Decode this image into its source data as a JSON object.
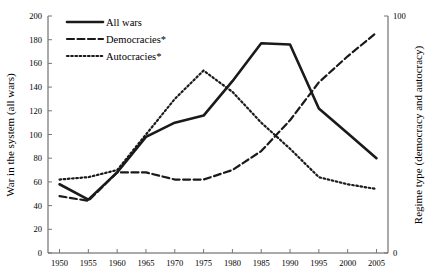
{
  "chart_data": {
    "type": "line",
    "title": "",
    "xlabel": "",
    "ylabel": "War in the system (all wars)",
    "y2label": "Regime type (democracy and autocracy)",
    "x": [
      1950,
      1955,
      1960,
      1965,
      1970,
      1975,
      1980,
      1985,
      1990,
      1995,
      2000,
      2005
    ],
    "xlim": [
      1948,
      2007
    ],
    "ylim": [
      0,
      200
    ],
    "y2lim": [
      0,
      100
    ],
    "yticks": [
      0,
      20,
      40,
      60,
      80,
      100,
      120,
      140,
      160,
      180,
      200
    ],
    "y2ticks": [
      0,
      100
    ],
    "xticks": [
      1950,
      1955,
      1960,
      1965,
      1970,
      1975,
      1980,
      1985,
      1990,
      1995,
      2000,
      2005
    ],
    "grid": false,
    "legend_position": "top-left",
    "series": [
      {
        "name": "All wars",
        "axis": "left",
        "style": "solid",
        "color": "#1a1a1a",
        "values": [
          58,
          45,
          68,
          98,
          110,
          116,
          145,
          177,
          176,
          122,
          101,
          80
        ]
      },
      {
        "name": "Democracies*",
        "axis": "right",
        "style": "dashed",
        "color": "#1a1a1a",
        "values": [
          24,
          22,
          34,
          34,
          31,
          31,
          35,
          43,
          56,
          72,
          83,
          93
        ]
      },
      {
        "name": "Autocracies*",
        "axis": "right",
        "style": "dotted",
        "color": "#1a1a1a",
        "values": [
          31,
          32,
          35,
          50,
          65,
          77,
          68,
          55,
          44,
          32,
          29,
          27
        ]
      }
    ]
  },
  "axes": {
    "left_title": "War in the system (all wars)",
    "right_title": "Regime type (democracy and autocracy)",
    "left_ticks": [
      "200",
      "180",
      "160",
      "140",
      "120",
      "100",
      "80",
      "60",
      "40",
      "20",
      "0"
    ],
    "right_ticks": [
      "100",
      "0"
    ],
    "x_ticks": [
      "1950",
      "1955",
      "1960",
      "1965",
      "1970",
      "1975",
      "1980",
      "1985",
      "1990",
      "1995",
      "2000",
      "2005"
    ]
  },
  "legend": {
    "items": [
      {
        "label": "All wars",
        "style": "solid"
      },
      {
        "label": "Democracies*",
        "style": "dashed"
      },
      {
        "label": "Autocracies*",
        "style": "dotted"
      }
    ]
  }
}
